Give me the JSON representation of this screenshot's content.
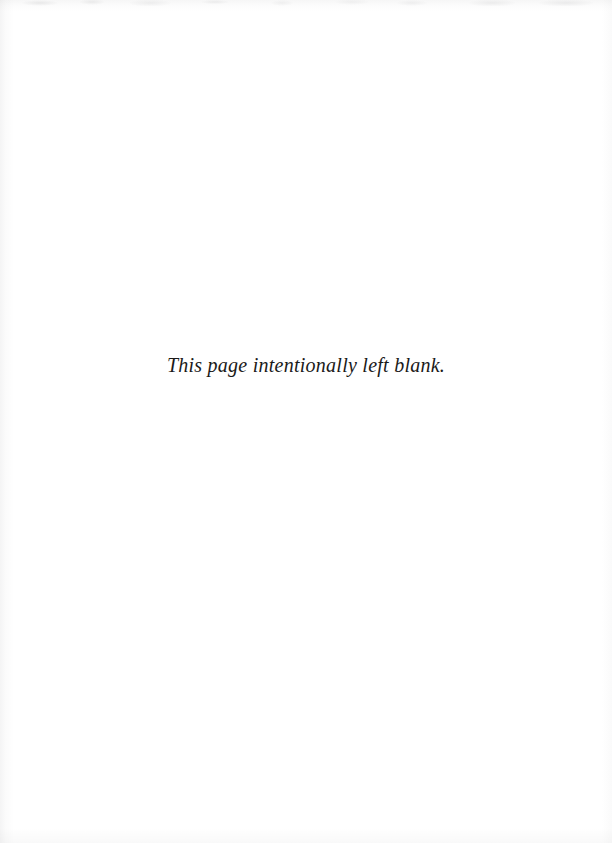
{
  "page": {
    "kind": "scanned-book-page",
    "width": 612,
    "height": 843,
    "background_color": "#ffffff",
    "text_color": "#1b1a19",
    "notice": "This page intentionally left blank.",
    "artifacts": {
      "top_edge_label": "scan-noise-top",
      "left_edge_label": "scan-shadow-left",
      "bottom_edge_label": "scan-noise-bottom",
      "right_edge_label": "scan-shadow-right"
    }
  }
}
